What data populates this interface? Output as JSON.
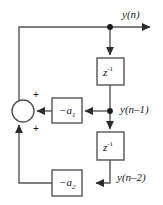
{
  "diagram": {
    "colors": {
      "line": "#4a4a4a",
      "block_border": "#4a4a4a",
      "text": "#1a1a1a",
      "background": "#ffffff",
      "node": "#1a1a1a"
    },
    "blocks": [
      {
        "id": "delay1",
        "label_base": "z",
        "label_exp": "-1",
        "x": 97,
        "y": 58,
        "w": 27,
        "h": 27
      },
      {
        "id": "delay2",
        "label_base": "z",
        "label_exp": "-1",
        "x": 97,
        "y": 132,
        "w": 27,
        "h": 28
      },
      {
        "id": "gain_a1",
        "label_base": "−a",
        "label_sub": "1",
        "x": 52,
        "y": 98,
        "w": 30,
        "h": 25
      },
      {
        "id": "gain_a2",
        "label_base": "−a",
        "label_sub": "2",
        "x": 52,
        "y": 170,
        "w": 30,
        "h": 26
      }
    ],
    "labels": {
      "output": "y(n)",
      "delay1_out": "y(n–1)",
      "delay2_out": "y(n–2)",
      "sum_plus_top": "+",
      "sum_plus_bottom": "+",
      "delay_block": "z⁻¹",
      "gain1": "−a₁",
      "gain2": "−a₂"
    },
    "summing_junction": {
      "cx": 23,
      "cy": 111,
      "r": 11
    },
    "nodes": [
      {
        "id": "node_out",
        "x": 110,
        "y": 30
      },
      {
        "id": "node_d1",
        "x": 110,
        "y": 111
      }
    ]
  }
}
